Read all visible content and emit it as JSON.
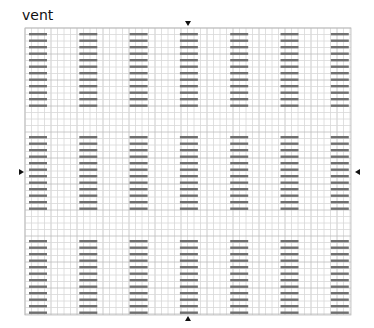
{
  "title": "vent",
  "layout": {
    "columns": 7,
    "blocks": 3,
    "bars_per_block": 12
  },
  "markers": {
    "top": "down-triangle",
    "bottom": "up-triangle",
    "left": "right-triangle",
    "right": "left-triangle"
  },
  "colors": {
    "grid_light": "#d8d8d8",
    "grid_dark": "#bcbcbc",
    "bar": "#707070",
    "marker": "#111111"
  }
}
